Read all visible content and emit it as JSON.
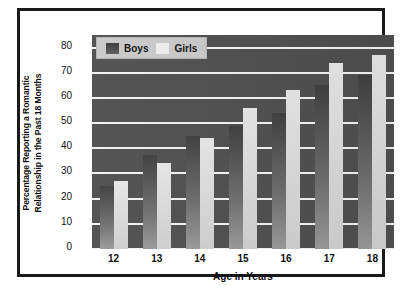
{
  "chart_data": {
    "type": "bar",
    "title": "",
    "xlabel": "Age in Years",
    "ylabel_line1": "Percentage Reporting a Romantic",
    "ylabel_line2": "Relationship in the Past 18 Months",
    "categories": [
      "12",
      "13",
      "14",
      "15",
      "16",
      "17",
      "18"
    ],
    "series": [
      {
        "name": "Boys",
        "color": "#555555",
        "values": [
          25,
          37.5,
          45,
          49,
          54,
          65,
          69
        ]
      },
      {
        "name": "Girls",
        "color": "#e0e0e0",
        "values": [
          27,
          34,
          44,
          56,
          63,
          74,
          77
        ]
      }
    ],
    "yticks": [
      80,
      70,
      60,
      50,
      40,
      30,
      20,
      10,
      0
    ],
    "ylim": [
      0,
      85
    ],
    "grid": true,
    "legend_position": "top-left",
    "plot_background": "#4f4f4f",
    "gridline_color": "#f2f2f2",
    "frame_border_color": "#1a1a1a"
  }
}
